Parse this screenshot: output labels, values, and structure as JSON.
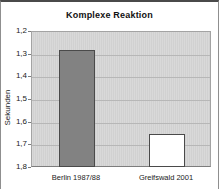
{
  "chart_data": {
    "type": "bar",
    "title": "Komplexe Reaktion",
    "xlabel": "",
    "ylabel": "Sekunden",
    "categories": [
      "Berlin 1987/88",
      "Greifswald 2001"
    ],
    "values": [
      1.28,
      1.65
    ],
    "series": [
      {
        "name": "Reaktionszeit",
        "values": [
          1.28,
          1.65
        ]
      }
    ],
    "y_axis": {
      "min": 1.2,
      "max": 1.8,
      "step": 0.1,
      "reversed": true,
      "tick_labels": [
        "1,2",
        "1,3",
        "1,4",
        "1,5",
        "1,6",
        "1,7",
        "1,8"
      ]
    },
    "grid": true,
    "legend": false,
    "bar_fill_colors": [
      "#828282",
      "#ffffff"
    ],
    "bar_border_color": "#4a4a4a",
    "plot_background_color": "#d5d5d5",
    "gridline_color": "#b7b7b7"
  }
}
